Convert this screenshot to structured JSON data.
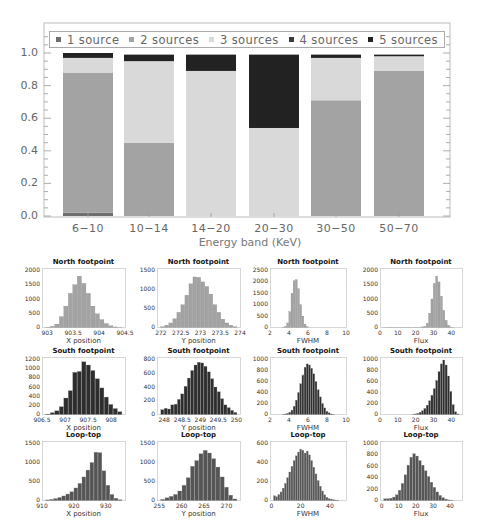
{
  "chart_data": [
    {
      "type": "bar",
      "stacked": true,
      "title": "",
      "xlabel": "Energy band (KeV)",
      "ylabel": "",
      "ylim": [
        0.0,
        1.1
      ],
      "yticks": [
        "0.0",
        "0.2",
        "0.4",
        "0.6",
        "0.8",
        "1.0"
      ],
      "categories": [
        "6-10",
        "10-14",
        "14-20",
        "20-30",
        "30-50",
        "50-70"
      ],
      "legend_position": "top (inside plot, horizontal)",
      "grid": false,
      "series": [
        {
          "name": "1 source",
          "color": "#6e6e6e",
          "values": [
            0.02,
            0.0,
            0.0,
            0.0,
            0.0,
            0.0
          ]
        },
        {
          "name": "2 sources",
          "color": "#a3a3a3",
          "values": [
            0.86,
            0.45,
            0.0,
            0.0,
            0.71,
            0.89
          ]
        },
        {
          "name": "3 sources",
          "color": "#d9d9d9",
          "values": [
            0.09,
            0.5,
            0.89,
            0.54,
            0.26,
            0.09
          ]
        },
        {
          "name": "4 sources",
          "color": "#3a3a3a",
          "values": [
            0.0,
            0.0,
            0.0,
            0.0,
            0.0,
            0.0
          ]
        },
        {
          "name": "5 sources",
          "color": "#222222",
          "values": [
            0.03,
            0.04,
            0.1,
            0.45,
            0.02,
            0.01
          ]
        }
      ]
    },
    {
      "type": "histogram",
      "grid_layout": {
        "rows": 3,
        "cols": 4
      },
      "panels": [
        {
          "title": "North footpoint",
          "xlabel": "X position",
          "color": "#a3a3a3",
          "xticks": [
            "903",
            "903.5",
            "904",
            "904.5"
          ],
          "xrange": [
            902.9,
            904.5
          ],
          "yticks": [
            "0",
            "500",
            "1000",
            "1500",
            "2000"
          ],
          "ymax": 2000,
          "bins": [
            10,
            40,
            120,
            380,
            750,
            1200,
            1500,
            1800,
            1550,
            1200,
            750,
            480,
            280,
            140,
            60,
            20,
            5
          ]
        },
        {
          "title": "North footpoint",
          "xlabel": "Y position",
          "color": "#a3a3a3",
          "xticks": [
            "272",
            "272.5",
            "273",
            "273.5",
            "274"
          ],
          "xrange": [
            271.9,
            274.0
          ],
          "yticks": [
            "0",
            "500",
            "1000",
            "1500"
          ],
          "ymax": 1500,
          "bins": [
            20,
            60,
            120,
            230,
            400,
            600,
            850,
            1150,
            1330,
            1320,
            1200,
            1080,
            880,
            600,
            400,
            220,
            120,
            60,
            20
          ]
        },
        {
          "title": "North footpoint",
          "xlabel": "FWHM",
          "color": "#a3a3a3",
          "xticks": [
            "2",
            "4",
            "6",
            "8",
            "10"
          ],
          "xrange": [
            2,
            10
          ],
          "yticks": [
            "0",
            "500",
            "1000",
            "1500",
            "2000",
            "2500"
          ],
          "ymax": 2500,
          "bins": [
            0,
            0,
            0,
            0,
            10,
            50,
            200,
            700,
            1500,
            2050,
            2100,
            1700,
            1000,
            500,
            150,
            30,
            0,
            0,
            0,
            0,
            0,
            0,
            0,
            0,
            0,
            0,
            0,
            0,
            0,
            0,
            0,
            0
          ]
        },
        {
          "title": "North footpoint",
          "xlabel": "Flux",
          "color": "#a3a3a3",
          "xticks": [
            "0",
            "10",
            "20",
            "30",
            "40"
          ],
          "xrange": [
            0,
            46
          ],
          "yticks": [
            "0",
            "500",
            "1000",
            "1500",
            "2000"
          ],
          "ymax": 2000,
          "bins": [
            5,
            5,
            5,
            5,
            5,
            5,
            5,
            5,
            5,
            5,
            5,
            5,
            5,
            5,
            5,
            10,
            20,
            40,
            150,
            500,
            1000,
            1550,
            1800,
            1600,
            1100,
            600,
            250,
            80,
            20,
            5,
            0,
            0
          ]
        },
        {
          "title": "South footpoint",
          "xlabel": "X position",
          "color": "#2e2e2e",
          "xticks": [
            "906.5",
            "907",
            "907.5",
            "908"
          ],
          "xrange": [
            906.5,
            908.3
          ],
          "yticks": [
            "0",
            "200",
            "400",
            "600",
            "800",
            "1000",
            "1200"
          ],
          "ymax": 1200,
          "bins": [
            10,
            40,
            80,
            170,
            360,
            520,
            920,
            940,
            1150,
            1080,
            960,
            780,
            580,
            380,
            220,
            130,
            60
          ]
        },
        {
          "title": "South footpoint",
          "xlabel": "Y position",
          "color": "#2e2e2e",
          "xticks": [
            "248",
            "248.5",
            "249",
            "249.5",
            "250"
          ],
          "xrange": [
            247.8,
            250.1
          ],
          "yticks": [
            "0",
            "200",
            "400",
            "600",
            "800"
          ],
          "ymax": 800,
          "bins": [
            70,
            90,
            80,
            140,
            150,
            220,
            300,
            410,
            530,
            640,
            720,
            760,
            750,
            700,
            620,
            520,
            400,
            330,
            230,
            140,
            100,
            60,
            30
          ]
        },
        {
          "title": "South footpoint",
          "xlabel": "FWHM",
          "color": "#2e2e2e",
          "xticks": [
            "2",
            "4",
            "6",
            "8",
            "10"
          ],
          "xrange": [
            2,
            10
          ],
          "yticks": [
            "0",
            "200",
            "400",
            "600",
            "800",
            "1000"
          ],
          "ymax": 1000,
          "bins": [
            0,
            0,
            0,
            0,
            5,
            10,
            20,
            40,
            80,
            150,
            260,
            400,
            560,
            720,
            860,
            920,
            900,
            840,
            740,
            600,
            450,
            320,
            200,
            120,
            60,
            30,
            10,
            5,
            0,
            0,
            0,
            0
          ]
        },
        {
          "title": "South footpoint",
          "xlabel": "Flux",
          "color": "#2e2e2e",
          "xticks": [
            "0",
            "10",
            "20",
            "30",
            "40"
          ],
          "xrange": [
            0,
            46
          ],
          "yticks": [
            "0",
            "200",
            "400",
            "600",
            "800",
            "1000"
          ],
          "ymax": 1000,
          "bins": [
            0,
            0,
            0,
            0,
            0,
            0,
            0,
            0,
            0,
            0,
            0,
            0,
            5,
            10,
            20,
            40,
            70,
            110,
            170,
            250,
            350,
            470,
            620,
            780,
            920,
            990,
            900,
            700,
            420,
            180,
            50,
            10
          ]
        },
        {
          "title": "Loop-top",
          "xlabel": "X position",
          "color": "#555555",
          "xticks": [
            "910",
            "920",
            "930"
          ],
          "xrange": [
            910,
            936
          ],
          "yticks": [
            "0",
            "500",
            "1000",
            "1500"
          ],
          "ymax": 1500,
          "bins": [
            15,
            30,
            50,
            80,
            120,
            170,
            230,
            330,
            450,
            620,
            800,
            1000,
            1270,
            1260,
            780,
            400,
            160,
            60,
            20
          ]
        },
        {
          "title": "Loop-top",
          "xlabel": "Y position",
          "color": "#555555",
          "xticks": [
            "255",
            "260",
            "265",
            "270"
          ],
          "xrange": [
            254.5,
            273
          ],
          "yticks": [
            "0",
            "500",
            "1000",
            "1500"
          ],
          "ymax": 1500,
          "bins": [
            30,
            70,
            110,
            160,
            250,
            400,
            600,
            900,
            1050,
            1230,
            1320,
            1250,
            1100,
            880,
            620,
            350,
            140,
            40
          ]
        },
        {
          "title": "Loop-top",
          "xlabel": "FWHM",
          "color": "#555555",
          "xticks": [
            "0",
            "20",
            "40"
          ],
          "xrange": [
            -1,
            51
          ],
          "yticks": [
            "0",
            "200",
            "400",
            "600"
          ],
          "ymax": 600,
          "bins": [
            50,
            40,
            60,
            90,
            130,
            180,
            240,
            300,
            360,
            420,
            470,
            510,
            540,
            530,
            500,
            520,
            480,
            420,
            350,
            280,
            210,
            150,
            100,
            60,
            35,
            20,
            15,
            10,
            5,
            5,
            0,
            0
          ]
        },
        {
          "title": "Loop-top",
          "xlabel": "Flux",
          "color": "#555555",
          "xticks": [
            "0",
            "10",
            "20",
            "30",
            "40"
          ],
          "xrange": [
            -1,
            47
          ],
          "yticks": [
            "0",
            "200",
            "400",
            "600",
            "800",
            "1000"
          ],
          "ymax": 1000,
          "bins": [
            30,
            30,
            40,
            60,
            100,
            180,
            300,
            450,
            620,
            760,
            820,
            780,
            700,
            620,
            520,
            420,
            320,
            230,
            150,
            90,
            50,
            25,
            10,
            5,
            0,
            0
          ]
        }
      ]
    }
  ]
}
